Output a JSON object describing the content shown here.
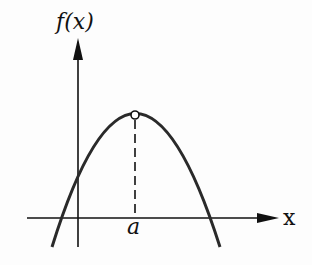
{
  "diagram": {
    "y_axis_label": "f(x)",
    "x_axis_label": "x",
    "vertex_label": "a",
    "colors": {
      "ink": "#111111",
      "curve": "#2a2a2a",
      "background": "#fdfdfd"
    }
  }
}
